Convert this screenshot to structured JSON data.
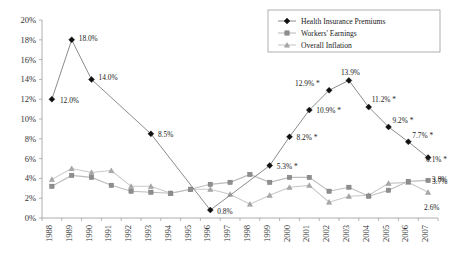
{
  "chart_data": {
    "type": "line",
    "title": "",
    "xlabel": "",
    "ylabel": "",
    "ylim": [
      0,
      20
    ],
    "ytick_step": 2,
    "grid": false,
    "legend_position": "top-right",
    "categories": [
      "1988",
      "1989",
      "1990",
      "1991",
      "1992",
      "1993",
      "1994",
      "1995",
      "1996",
      "1997",
      "1998",
      "1999",
      "2000",
      "2001",
      "2002",
      "2003",
      "2004",
      "2005",
      "2006",
      "2007"
    ],
    "ytick_labels": [
      "0%",
      "2%",
      "4%",
      "6%",
      "8%",
      "10%",
      "12%",
      "14%",
      "16%",
      "18%",
      "20%"
    ],
    "series": [
      {
        "name": "Health Insurance Premiums",
        "marker": "diamond",
        "color": "#111111",
        "values": [
          12.0,
          18.0,
          14.0,
          null,
          null,
          8.5,
          null,
          null,
          0.8,
          null,
          null,
          5.3,
          8.2,
          10.9,
          12.9,
          13.9,
          11.2,
          9.2,
          7.7,
          6.1
        ]
      },
      {
        "name": "Workers' Earnings",
        "marker": "square",
        "color": "#8e8e8e",
        "values": [
          3.2,
          4.3,
          4.1,
          3.3,
          2.7,
          2.6,
          2.5,
          2.9,
          3.4,
          3.6,
          4.4,
          3.6,
          4.1,
          4.1,
          2.7,
          3.1,
          2.2,
          2.8,
          3.7,
          3.8
        ]
      },
      {
        "name": "Overall Inflation",
        "marker": "triangle",
        "color": "#a8a8a8",
        "values": [
          3.9,
          5.0,
          4.6,
          4.8,
          3.2,
          3.2,
          2.5,
          2.9,
          2.9,
          2.4,
          1.4,
          2.3,
          3.1,
          3.3,
          1.6,
          2.2,
          2.3,
          3.5,
          3.6,
          2.6
        ]
      }
    ],
    "annotations": [
      {
        "label": "12.0%",
        "year": "1988",
        "value": 12.0,
        "dx": 8,
        "dy": 4
      },
      {
        "label": "18.0%",
        "year": "1989",
        "value": 18.0,
        "dx": 7,
        "dy": 1
      },
      {
        "label": "14.0%",
        "year": "1990",
        "value": 14.0,
        "dx": 7,
        "dy": 1
      },
      {
        "label": "8.5%",
        "year": "1993",
        "value": 8.5,
        "dx": 7,
        "dy": 3
      },
      {
        "label": "0.8%",
        "year": "1996",
        "value": 0.8,
        "dx": 7,
        "dy": 4
      },
      {
        "label": "5.3% *",
        "year": "1999",
        "value": 5.3,
        "dx": 7,
        "dy": 3
      },
      {
        "label": "8.2% *",
        "year": "2000",
        "value": 8.2,
        "dx": 7,
        "dy": 3
      },
      {
        "label": "10.9% *",
        "year": "2001",
        "value": 10.9,
        "dx": 7,
        "dy": 3
      },
      {
        "label": "12.9% *",
        "year": "2002",
        "value": 12.9,
        "dx": -34,
        "dy": -4
      },
      {
        "label": "13.9%",
        "year": "2003",
        "value": 13.9,
        "dx": -8,
        "dy": -5
      },
      {
        "label": "11.2% *",
        "year": "2004",
        "value": 11.2,
        "dx": 3,
        "dy": -5
      },
      {
        "label": "9.2% *",
        "year": "2005",
        "value": 9.2,
        "dx": 4,
        "dy": -4
      },
      {
        "label": "7.7% *",
        "year": "2006",
        "value": 7.7,
        "dx": 4,
        "dy": -4
      },
      {
        "label": "6.1% *",
        "year": "2007",
        "value": 6.1,
        "dx": -2,
        "dy": 4
      },
      {
        "label": "3.8%",
        "year": "2007",
        "value": 3.8,
        "dx": 4,
        "dy": 2
      },
      {
        "label": "3.7%",
        "year": "2007",
        "value": 3.7,
        "dx": 4,
        "dy": 3
      },
      {
        "label": "2.6%",
        "year": "2007",
        "value": 2.6,
        "dx": -4,
        "dy": 18
      }
    ]
  },
  "legend": {
    "items": [
      {
        "label": "Health Insurance Premiums",
        "marker": "diamond"
      },
      {
        "label": "Workers' Earnings",
        "marker": "square"
      },
      {
        "label": "Overall Inflation",
        "marker": "triangle"
      }
    ]
  }
}
